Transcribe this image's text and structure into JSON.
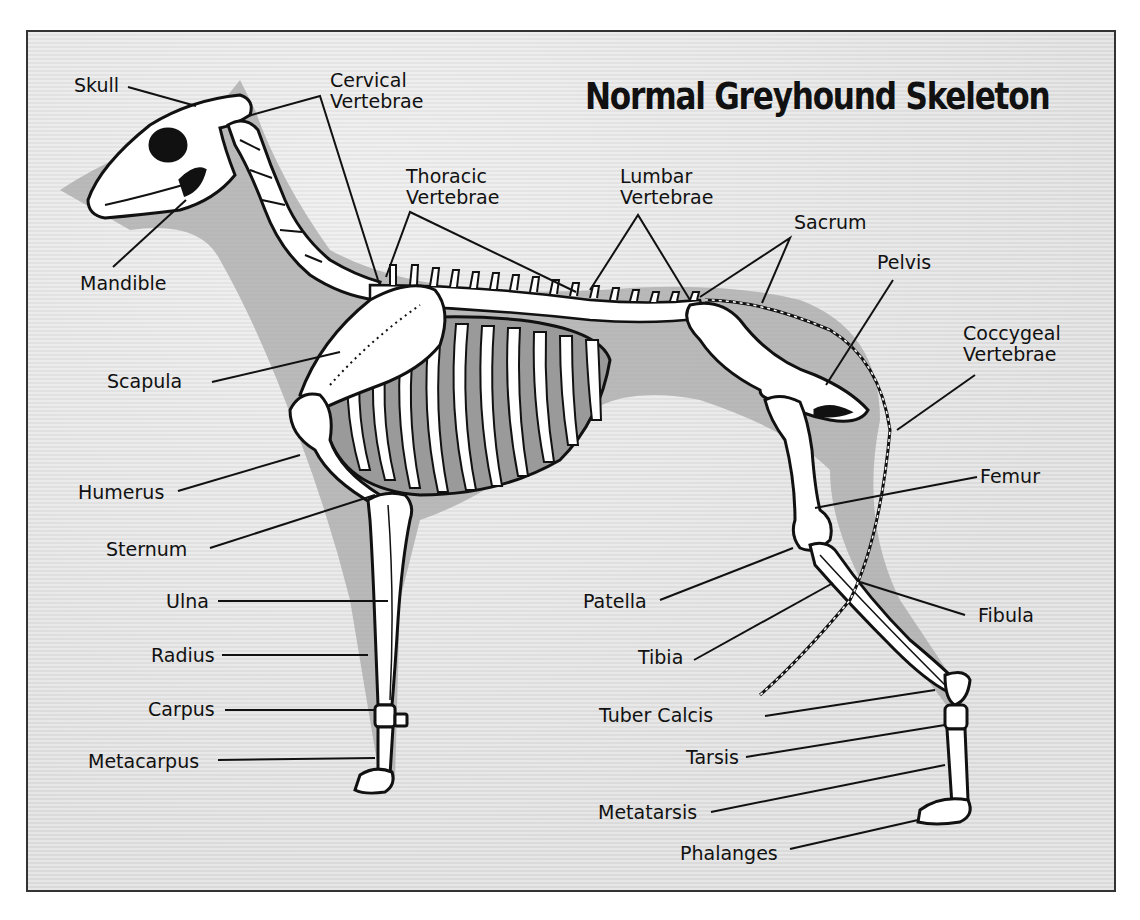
{
  "title": "Normal Greyhound Skeleton",
  "labels": {
    "skull": "Skull",
    "cervical_l1": "Cervical",
    "cervical_l2": "Vertebrae",
    "thoracic_l1": "Thoracic",
    "thoracic_l2": "Vertebrae",
    "lumbar_l1": "Lumbar",
    "lumbar_l2": "Vertebrae",
    "sacrum": "Sacrum",
    "pelvis": "Pelvis",
    "coccygeal_l1": "Coccygeal",
    "coccygeal_l2": "Vertebrae",
    "mandible": "Mandible",
    "scapula": "Scapula",
    "humerus": "Humerus",
    "sternum": "Sternum",
    "ulna": "Ulna",
    "radius": "Radius",
    "carpus": "Carpus",
    "metacarpus": "Metacarpus",
    "femur": "Femur",
    "patella": "Patella",
    "fibula": "Fibula",
    "tibia": "Tibia",
    "tuber_calcis": "Tuber Calcis",
    "tarsis": "Tarsis",
    "metatarsis": "Metatarsis",
    "phalanges": "Phalanges"
  },
  "colors": {
    "background": "#e4e4e4",
    "shadow": "#a9a9a9",
    "bone": "#ffffff",
    "outline": "#111111",
    "ribcage_fill": "#9a9a9a"
  }
}
